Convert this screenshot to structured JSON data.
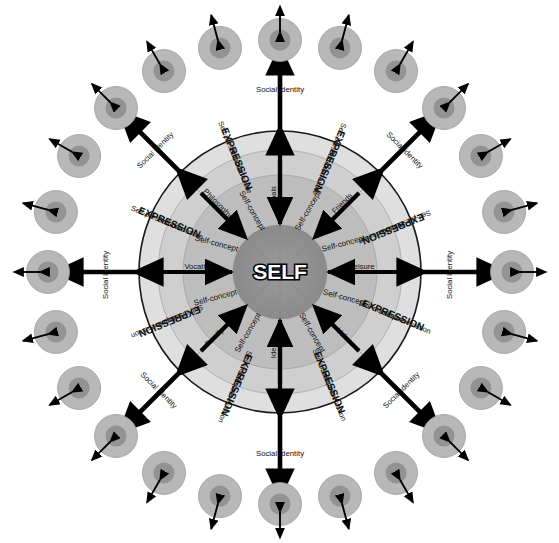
{
  "figure": {
    "type": "concentric-radial-diagram",
    "background_color": "#ffffff"
  },
  "core": {
    "label": "SELF",
    "text_color": "#ffffff",
    "outline_color": "#000000",
    "fill_color": "#8f8f8f"
  },
  "rings": [
    {
      "name": "core-self",
      "label": "SELF",
      "fill": "#8f8f8f"
    },
    {
      "name": "self-concept-ring",
      "label": "Self-concept",
      "fill": "#b4b4b4"
    },
    {
      "name": "domain-ring",
      "label": "life domains",
      "fill": "#c8c8c8"
    },
    {
      "name": "expression-ring",
      "label": "EXPRESSION",
      "fill": "#dcdcdc"
    }
  ],
  "ring_labels": {
    "self_concept": "Self-concept",
    "expression": "EXPRESSION",
    "self_presentation": "Self-presentation",
    "self_disclosure": "Self-disclosure",
    "social_identity": "Social identity"
  },
  "spokes": [
    {
      "index": 0,
      "angle_deg": 270,
      "label": "Goals",
      "inner_label": "Self-concept",
      "direction": "inward"
    },
    {
      "index": 1,
      "angle_deg": 315,
      "label": "Friends",
      "inner_label": "Self-concept",
      "direction": "inward"
    },
    {
      "index": 2,
      "angle_deg": 0,
      "label": "Leisure",
      "inner_label": "Self-concept",
      "direction": "inward"
    },
    {
      "index": 3,
      "angle_deg": 45,
      "label": "Values",
      "inner_label": "Self-concept",
      "direction": "inward"
    },
    {
      "index": 4,
      "angle_deg": 90,
      "label": "Ideals",
      "inner_label": "Self-concept",
      "direction": "inward"
    },
    {
      "index": 5,
      "angle_deg": 135,
      "label": "Family",
      "inner_label": "Self-concept",
      "direction": "inward"
    },
    {
      "index": 6,
      "angle_deg": 180,
      "label": "Vocation",
      "inner_label": "Self-concept",
      "direction": "inward"
    },
    {
      "index": 7,
      "angle_deg": 225,
      "label": "Philosophy",
      "inner_label": "Self-concept",
      "direction": "inward"
    }
  ],
  "sectors": [
    {
      "index": 0,
      "center_angle_deg": 292.5,
      "outer": "Self-presentation",
      "middle": "EXPRESSION",
      "inner": "Self-disclosure"
    },
    {
      "index": 1,
      "center_angle_deg": 337.5,
      "outer": "Self-presentation",
      "middle": "EXPRESSION",
      "inner": "Self-disclosure"
    },
    {
      "index": 2,
      "center_angle_deg": 22.5,
      "outer": "Self-presentation",
      "middle": "EXPRESSION",
      "inner": "Self-disclosure"
    },
    {
      "index": 3,
      "center_angle_deg": 67.5,
      "outer": "Self-presentation",
      "middle": "EXPRESSION",
      "inner": "Self-disclosure"
    },
    {
      "index": 4,
      "center_angle_deg": 112.5,
      "outer": "Self-presentation",
      "middle": "EXPRESSION",
      "inner": "Self-disclosure"
    },
    {
      "index": 5,
      "center_angle_deg": 157.5,
      "outer": "Self-presentation",
      "middle": "EXPRESSION",
      "inner": "Self-disclosure"
    },
    {
      "index": 6,
      "center_angle_deg": 202.5,
      "outer": "Self-presentation",
      "middle": "EXPRESSION",
      "inner": "Self-disclosure"
    },
    {
      "index": 7,
      "center_angle_deg": 247.5,
      "outer": "Self-presentation",
      "middle": "EXPRESSION",
      "inner": "Self-disclosure"
    }
  ],
  "social_identity_arrows": [
    {
      "index": 0,
      "angle_deg": 270,
      "label": "Social identity",
      "arrow": "double-headed"
    },
    {
      "index": 1,
      "angle_deg": 315,
      "label": "Social identity",
      "arrow": "double-headed"
    },
    {
      "index": 2,
      "angle_deg": 0,
      "label": "Social identity",
      "arrow": "double-headed"
    },
    {
      "index": 3,
      "angle_deg": 45,
      "label": "Social identity",
      "arrow": "double-headed"
    },
    {
      "index": 4,
      "angle_deg": 90,
      "label": "Social identity",
      "arrow": "double-headed"
    },
    {
      "index": 5,
      "angle_deg": 135,
      "label": "Social identity",
      "arrow": "double-headed"
    },
    {
      "index": 6,
      "angle_deg": 180,
      "label": "Social identity",
      "arrow": "double-headed"
    },
    {
      "index": 7,
      "angle_deg": 225,
      "label": "Social identity",
      "arrow": "double-headed"
    }
  ],
  "other_people": {
    "count": 24,
    "description": "small two-tone circles representing other persons",
    "outer_fill": "#b8b8b8",
    "inner_fill": "#939393",
    "arrow": "double-headed-small"
  },
  "colors": {
    "ring_outer": "#dcdcdc",
    "ring_domain": "#c8c8c8",
    "ring_self_concept": "#b4b4b4",
    "core": "#8f8f8f",
    "stroke": "#1a1a1a",
    "arrow": "#000000",
    "person_outer": "#b8b8b8",
    "person_inner": "#939393",
    "text": "#0f0f0f"
  }
}
